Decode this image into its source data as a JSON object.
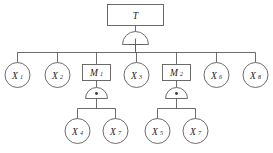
{
  "diagram": {
    "type": "fault-tree",
    "background_color": "#ffffff",
    "line_color": "#5b5b5b",
    "text_color": "#1d1d1d"
  },
  "top_event": {
    "id": "T",
    "shape": "rectangle",
    "label": "T",
    "subscript": ""
  },
  "gates": [
    {
      "id": "gate-top",
      "type": "OR",
      "symbol": "+",
      "parent": "T",
      "children": [
        "X1",
        "X2",
        "M1",
        "X3",
        "M2",
        "X6",
        "X8"
      ]
    },
    {
      "id": "gate-m1",
      "type": "AND",
      "symbol": "·",
      "parent": "M1",
      "children": [
        "X4",
        "X7a"
      ]
    },
    {
      "id": "gate-m2",
      "type": "AND",
      "symbol": "·",
      "parent": "M2",
      "children": [
        "X5",
        "X7b"
      ]
    }
  ],
  "nodes": {
    "X1": {
      "label": "X",
      "subscript": "1",
      "shape": "circle"
    },
    "X2": {
      "label": "X",
      "subscript": "2",
      "shape": "circle"
    },
    "M1": {
      "label": "M",
      "subscript": "1",
      "shape": "rectangle"
    },
    "X3": {
      "label": "X",
      "subscript": "3",
      "shape": "circle"
    },
    "M2": {
      "label": "M",
      "subscript": "2",
      "shape": "rectangle"
    },
    "X6": {
      "label": "X",
      "subscript": "6",
      "shape": "circle"
    },
    "X8": {
      "label": "X",
      "subscript": "8",
      "shape": "circle"
    },
    "X4": {
      "label": "X",
      "subscript": "4",
      "shape": "circle"
    },
    "X7a": {
      "label": "X",
      "subscript": "7",
      "shape": "circle"
    },
    "X5": {
      "label": "X",
      "subscript": "5",
      "shape": "circle"
    },
    "X7b": {
      "label": "X",
      "subscript": "7",
      "shape": "circle"
    }
  }
}
